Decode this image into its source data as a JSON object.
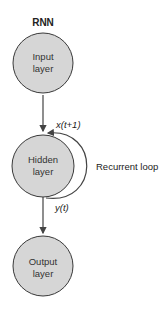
{
  "title": "RNN",
  "nodes": [
    {
      "id": "input",
      "line1": "Input",
      "line2": "layer"
    },
    {
      "id": "hidden",
      "line1": "Hidden",
      "line2": "layer"
    },
    {
      "id": "output",
      "line1": "Output",
      "line2": "layer"
    }
  ],
  "annotations": {
    "loop_in": "x(t+1)",
    "loop_out": "y(t)",
    "loop_label": "Recurrent loop"
  },
  "colors": {
    "node_fill": "#d6d6d6",
    "stroke": "#3a3a3a"
  }
}
